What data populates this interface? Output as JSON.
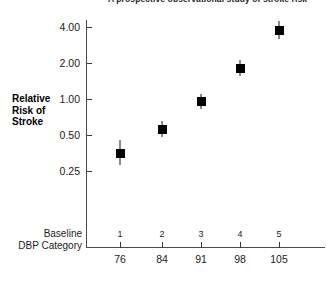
{
  "chart_data": {
    "type": "scatter",
    "title": "A prospective observational study of stroke risk",
    "xlabel": "Baseline DBP Category",
    "ylabel": "Relative Risk of Stroke",
    "yscale": "log",
    "ylim": [
      0.19,
      4.9
    ],
    "ytick_labels": [
      "4.00",
      "2.00",
      "1.00",
      "0.50",
      "0.25"
    ],
    "ytick_values": [
      4.0,
      2.0,
      1.0,
      0.5,
      0.25
    ],
    "grid": false,
    "legend": "none",
    "marker": "filled-square",
    "marker_color": "#000000",
    "errorbar_color": "#151515",
    "categories": [
      "1",
      "2",
      "3",
      "4",
      "5"
    ],
    "x_value_labels": [
      "76",
      "84",
      "91",
      "98",
      "105"
    ],
    "x_values": [
      76,
      84,
      91,
      98,
      105
    ],
    "values": [
      0.35,
      0.56,
      0.95,
      1.8,
      3.75
    ],
    "error_low": [
      0.28,
      0.48,
      0.83,
      1.55,
      3.15
    ],
    "error_high": [
      0.45,
      0.66,
      1.11,
      2.12,
      4.45
    ],
    "points": [
      {
        "category": "1",
        "dbp": "76",
        "value": 0.35,
        "low": 0.28,
        "high": 0.45
      },
      {
        "category": "2",
        "dbp": "84",
        "value": 0.56,
        "low": 0.48,
        "high": 0.66
      },
      {
        "category": "3",
        "dbp": "91",
        "value": 0.95,
        "low": 0.83,
        "high": 1.11
      },
      {
        "category": "4",
        "dbp": "98",
        "value": 1.8,
        "low": 1.55,
        "high": 2.12
      },
      {
        "category": "5",
        "dbp": "105",
        "value": 3.75,
        "low": 3.15,
        "high": 4.45
      }
    ]
  },
  "axes": {
    "y_title_lines": [
      "Relative",
      "Risk of",
      "Stroke"
    ],
    "x_title_lines": [
      "Baseline",
      "DBP Category"
    ]
  }
}
